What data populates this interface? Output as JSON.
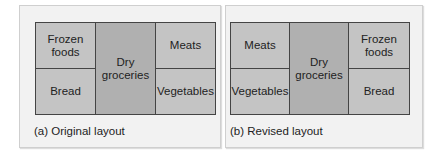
{
  "panels": [
    {
      "caption": "(a) Original layout",
      "cells": {
        "top_left": "Frozen\nfoods",
        "bottom_left": "Bread",
        "center": "Dry\ngroceries",
        "top_right": "Meats",
        "bottom_right": "Vegetables"
      }
    },
    {
      "caption": "(b) Revised layout",
      "cells": {
        "top_left": "Meats",
        "bottom_left": "Vegetables",
        "center": "Dry\ngroceries",
        "top_right": "Frozen\nfoods",
        "bottom_right": "Bread"
      }
    }
  ],
  "colors": {
    "side_cell": "#c4c4c4",
    "center_cell": "#b0b0b0",
    "panel_bg": "#f2f2f2",
    "border": "#444444"
  }
}
